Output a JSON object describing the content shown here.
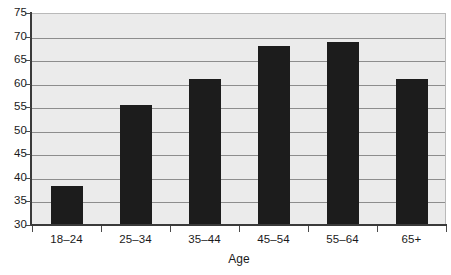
{
  "chart_data": {
    "type": "bar",
    "title": "",
    "subtitle": "",
    "xlabel": "Age",
    "ylabel": "",
    "categories": [
      "18–24",
      "25–34",
      "35–44",
      "45–54",
      "55–64",
      "65+"
    ],
    "values": [
      38.0,
      55.3,
      60.7,
      67.8,
      68.7,
      60.7
    ],
    "series": [
      {
        "name": "",
        "values": [
          38.0,
          55.3,
          60.7,
          67.8,
          68.7,
          60.7
        ]
      }
    ],
    "ylim": [
      30,
      75
    ],
    "ytick_labels": [
      "75",
      "70",
      "65",
      "60",
      "55",
      "50",
      "45",
      "40",
      "35",
      "30"
    ],
    "ytick_values": [
      75,
      70,
      65,
      60,
      55,
      50,
      45,
      40,
      35,
      30
    ],
    "ytick_interval": 5,
    "grid": "horizontal",
    "legend": "none",
    "annotations": [],
    "colors": {
      "bar": "#1c1c1c",
      "plot_background": "#ebebeb",
      "gridline": "#8d8d8d",
      "axis_line": "#3a3a3a",
      "text": "#1a1a1a",
      "plot_border": "#b9b9b9"
    }
  }
}
